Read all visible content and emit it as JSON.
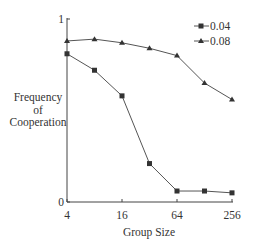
{
  "chart_data": {
    "type": "line",
    "title": "",
    "xlabel": "Group Size",
    "ylabel": "Frequency of Cooperation",
    "ylabel_lines": [
      "Frequency",
      "of",
      "Cooperation"
    ],
    "x_scale": "log2",
    "x": [
      4,
      8,
      16,
      32,
      64,
      128,
      256
    ],
    "x_tick_labels": [
      "4",
      "16",
      "64",
      "256"
    ],
    "x_ticks": [
      4,
      16,
      64,
      256
    ],
    "y_tick_labels": [
      "0",
      "1"
    ],
    "ylim": [
      0,
      1
    ],
    "grid": false,
    "legend_position": "top-right",
    "series": [
      {
        "name": "0.04",
        "marker": "square",
        "values": [
          0.81,
          0.72,
          0.58,
          0.21,
          0.06,
          0.06,
          0.05
        ]
      },
      {
        "name": "0.08",
        "marker": "triangle",
        "values": [
          0.88,
          0.89,
          0.87,
          0.84,
          0.8,
          0.65,
          0.56
        ]
      }
    ]
  },
  "colors": {
    "line": "#555555",
    "marker": "#333333",
    "axis": "#444444"
  }
}
